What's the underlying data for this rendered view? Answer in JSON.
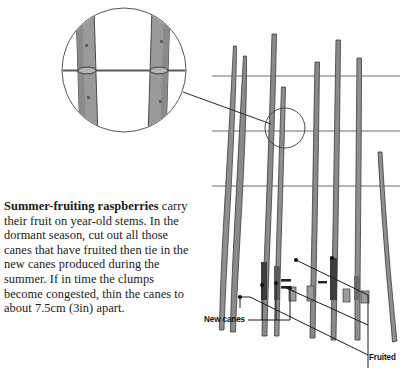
{
  "page": {
    "width": 404,
    "height": 372,
    "background_color": "#fefefe"
  },
  "body_text": {
    "lead_in": "Summer-fruiting raspberries",
    "rest": " carry their fruit on year-old stems. In the dormant season, cut out all those canes that have fruited then tie in the new canes produced during the summer. If in time the clumps become congested, thin the canes to about 7.5cm (3in) apart."
  },
  "labels": {
    "new_canes": "New canes",
    "fruited": "Fruited"
  },
  "colors": {
    "ink": "#1a1a1a",
    "line": "#4a4a4a",
    "wire": "#6e6e6e",
    "cane_fill": "#9a9a9a",
    "cane_fill_dark": "#7d7d7d",
    "cane_stroke": "#3a3a3a",
    "inset_circle_stroke": "#555555",
    "background": "#fefefe"
  },
  "diagram": {
    "inset": {
      "name": "magnified-tie-detail",
      "center_x": 124,
      "center_y": 70,
      "radius": 62,
      "shows": "two canes tied to a horizontal support wire"
    },
    "detail_marker": {
      "center_x": 285,
      "center_y": 128,
      "radius": 20
    },
    "wires": [
      {
        "y": 76,
        "x1": 212,
        "x2": 400
      },
      {
        "y": 131,
        "x1": 212,
        "x2": 400
      },
      {
        "y": 186,
        "x1": 212,
        "x2": 400
      }
    ],
    "wire_count": 3,
    "new_cane_count": 4,
    "fruited_cane_count": 4
  }
}
